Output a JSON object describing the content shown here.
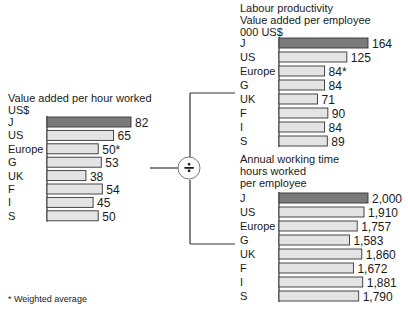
{
  "chart_data": [
    {
      "type": "bar",
      "orientation": "horizontal",
      "title": "Value added per hour worked",
      "unit": "US$",
      "categories": [
        "J",
        "US",
        "Europe",
        "G",
        "UK",
        "F",
        "I",
        "S"
      ],
      "values": [
        82,
        65,
        50,
        53,
        38,
        54,
        45,
        50
      ],
      "labels": [
        "82",
        "65",
        "50*",
        "53",
        "38",
        "54",
        "45",
        "50"
      ],
      "highlight_index": 0,
      "xlim": [
        0,
        100
      ]
    },
    {
      "type": "bar",
      "orientation": "horizontal",
      "title": "Labour productivity",
      "subtitle": "Value added per employee",
      "unit": "000 US$",
      "categories": [
        "J",
        "US",
        "Europe",
        "G",
        "UK",
        "F",
        "I",
        "S"
      ],
      "values": [
        164,
        125,
        84,
        84,
        71,
        90,
        84,
        89
      ],
      "labels": [
        "164",
        "125",
        "84*",
        "84",
        "71",
        "90",
        "84",
        "89"
      ],
      "highlight_index": 0,
      "xlim": [
        0,
        200
      ]
    },
    {
      "type": "bar",
      "orientation": "horizontal",
      "title": "Annual working time",
      "subtitle": "hours worked",
      "unit": "per employee",
      "categories": [
        "J",
        "US",
        "Europe",
        "G",
        "UK",
        "F",
        "I",
        "S"
      ],
      "values": [
        2000,
        1910,
        1757,
        1583,
        1860,
        1672,
        1881,
        1790
      ],
      "labels": [
        "2,000",
        "1,910",
        "1,757",
        "1,583",
        "1,860",
        "1,672",
        "1,881",
        "1,790"
      ],
      "highlight_index": 0,
      "xlim": [
        0,
        2000
      ]
    }
  ],
  "operator_symbol": "÷",
  "footnote": "* Weighted average",
  "colors": {
    "highlight_bar": "#7a7a7a",
    "bar": "#e4e4e4",
    "outline": "#333333",
    "text": "#1a1a1a"
  }
}
